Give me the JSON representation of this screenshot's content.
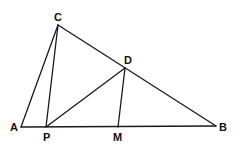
{
  "diagram": {
    "type": "geometry",
    "points": {
      "A": {
        "label": "A",
        "x": 21,
        "y": 127,
        "label_x": 10,
        "label_y": 131
      },
      "B": {
        "label": "B",
        "x": 216,
        "y": 126,
        "label_x": 219,
        "label_y": 131
      },
      "C": {
        "label": "C",
        "x": 58,
        "y": 25,
        "label_x": 54,
        "label_y": 21
      },
      "D": {
        "label": "D",
        "x": 125,
        "y": 68,
        "label_x": 124,
        "label_y": 64
      },
      "P": {
        "label": "P",
        "x": 46,
        "y": 127,
        "label_x": 43,
        "label_y": 141
      },
      "M": {
        "label": "M",
        "x": 118,
        "y": 127,
        "label_x": 113,
        "label_y": 141
      }
    },
    "segments": [
      [
        "A",
        "B"
      ],
      [
        "A",
        "C"
      ],
      [
        "C",
        "B"
      ],
      [
        "C",
        "P"
      ],
      [
        "P",
        "D"
      ],
      [
        "D",
        "M"
      ]
    ],
    "stroke_color": "#1a1a1a",
    "label_color": "#111111"
  }
}
